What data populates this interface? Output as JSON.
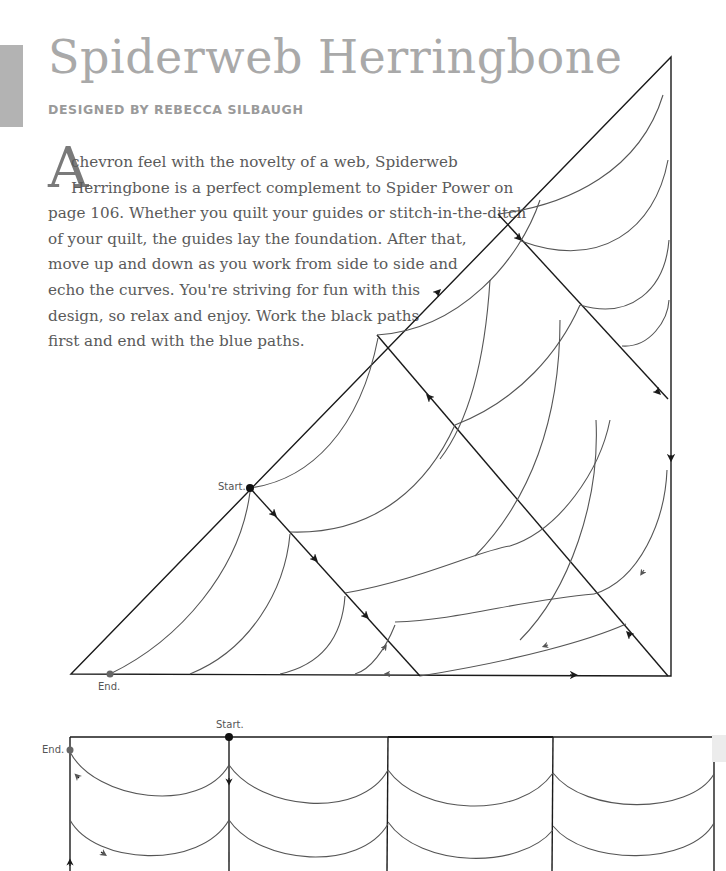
{
  "page": {
    "title": "Spiderweb Herringbone",
    "byline": "DESIGNED BY REBECCA SILBAUGH",
    "intro": {
      "dropcap": "A",
      "lines": [
        "chevron feel with the novelty of a web, Spiderweb",
        "Herringbone is a perfect complement to Spider Power on",
        "page 106. Whether you quilt your guides or stitch-in-the-ditch",
        "of your quilt, the guides lay the foundation. After that,",
        "move up and down as you work from side to side and",
        "echo the curves. You're striving for fun with this",
        "design, so relax and enjoy. Work the black paths",
        "first and end with the blue paths."
      ]
    }
  },
  "triangle_diagram": {
    "start_label": "Start.",
    "end_label": "End."
  },
  "grid_diagram": {
    "start_label": "Start.",
    "end_label": "End."
  },
  "colors": {
    "title": "#a9a9a9",
    "body_text": "#5a5a5a",
    "guide_line": "#1a1a1a",
    "curve_line": "#555555",
    "side_tab": "#b3b3b3"
  }
}
